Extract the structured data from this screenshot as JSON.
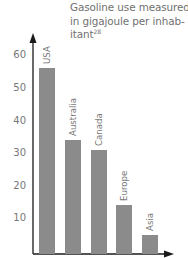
{
  "chart_data": {
    "type": "bar",
    "title_lines": [
      "Gasoline use measured",
      "in gigajoule per inhab-",
      "itant"
    ],
    "footnote_ref": "28",
    "categories": [
      "USA",
      "Australia",
      "Canada",
      "Europe",
      "Asia"
    ],
    "values": [
      56,
      34,
      31,
      14,
      5
    ],
    "xlabel": "",
    "ylabel": "",
    "yticks": [
      10,
      20,
      30,
      40,
      50,
      60
    ],
    "ytick_labels": [
      "10",
      "20",
      "30",
      "40",
      "50",
      "60"
    ],
    "ylim": [
      0,
      65
    ],
    "grid": false,
    "legend": null,
    "bar_color": "#8b8b8b",
    "label_position": "rotated above each bar"
  }
}
